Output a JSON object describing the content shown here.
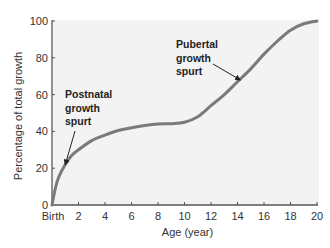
{
  "chart_data": {
    "type": "line",
    "title": "",
    "xlabel": "Age (year)",
    "ylabel": "Percentage of total growth",
    "xlim": [
      0,
      20
    ],
    "ylim": [
      0,
      100
    ],
    "grid": false,
    "x_ticks": [
      0,
      2,
      4,
      6,
      8,
      10,
      12,
      14,
      16,
      18,
      20
    ],
    "x_tick_labels": [
      "Birth",
      "2",
      "4",
      "6",
      "8",
      "10",
      "12",
      "14",
      "16",
      "18",
      "20"
    ],
    "y_ticks": [
      0,
      20,
      40,
      60,
      80,
      100
    ],
    "y_tick_labels": [
      "0",
      "20",
      "40",
      "60",
      "80",
      "100"
    ],
    "series": [
      {
        "name": "Growth",
        "color": "#7a7a7a",
        "x": [
          0,
          0.25,
          0.5,
          1,
          1.5,
          2,
          3,
          4,
          5,
          6,
          7,
          8,
          9,
          10,
          11,
          12,
          13,
          14,
          15,
          16,
          17,
          18,
          19,
          20
        ],
        "y": [
          0,
          9,
          15,
          22,
          27,
          30,
          35,
          38,
          40.5,
          42,
          43.2,
          44,
          44.2,
          45,
          48,
          54,
          60,
          67,
          74,
          82,
          89,
          95,
          98.5,
          100
        ]
      }
    ],
    "annotations": [
      {
        "lines": [
          "Postnatal",
          "growth",
          "spurt"
        ],
        "points_to": {
          "x": 1,
          "y": 22
        }
      },
      {
        "lines": [
          "Pubertal",
          "growth",
          "spurt"
        ],
        "points_to": {
          "x": 14.2,
          "y": 68
        }
      }
    ],
    "colors": {
      "plot_background": "#f3f3f3",
      "axis": "#555555",
      "curve": "#7a7a7a"
    }
  }
}
